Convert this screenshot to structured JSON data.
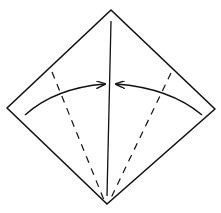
{
  "diagram": {
    "type": "origami-fold-step",
    "square": {
      "top": [
        111,
        10
      ],
      "left": [
        7,
        108
      ],
      "right": [
        215,
        109
      ],
      "bottom": [
        107,
        204
      ]
    },
    "center_crease": {
      "from": [
        111,
        21
      ],
      "to": [
        107,
        196
      ]
    },
    "valley_folds": [
      {
        "side": "left",
        "from": [
          52,
          72
        ],
        "to": [
          104,
          200
        ]
      },
      {
        "side": "right",
        "from": [
          171,
          73
        ],
        "to": [
          110,
          200
        ]
      }
    ],
    "arrows": [
      {
        "side": "left",
        "direction": "right",
        "from": [
          25,
          115
        ],
        "to": [
          106,
          84
        ]
      },
      {
        "side": "right",
        "direction": "left",
        "from": [
          202,
          115
        ],
        "to": [
          115,
          84
        ]
      }
    ],
    "stroke_color": "#111111"
  }
}
